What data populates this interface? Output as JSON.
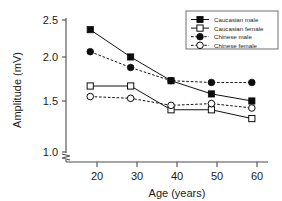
{
  "chart_data": {
    "type": "line",
    "title": "",
    "xlabel": "Age (years)",
    "ylabel": "Amplitude (mV)",
    "x": [
      20,
      30,
      40,
      50,
      60
    ],
    "xticklabels": [
      "20",
      "30",
      "40",
      "50",
      "60"
    ],
    "yticklabels": [
      "1.0",
      "1.5",
      "2.0",
      "2.5"
    ],
    "yticks": [
      1.0,
      1.5,
      2.0,
      2.5
    ],
    "xlim": [
      14,
      64
    ],
    "ylim": [
      0.95,
      2.55
    ],
    "grid": false,
    "axis_break_y": true,
    "legend_position": "top-right",
    "series": [
      {
        "name": "Caucasian male",
        "marker": "filled-square",
        "linestyle": "solid",
        "color": "#0d0d0d",
        "values": [
          2.39,
          2.08,
          1.81,
          1.66,
          1.58
        ]
      },
      {
        "name": "Caucasian female",
        "marker": "open-square",
        "linestyle": "solid",
        "color": "#0d0d0d",
        "values": [
          1.75,
          1.75,
          1.48,
          1.48,
          1.38
        ]
      },
      {
        "name": "Chinese male",
        "marker": "filled-circle",
        "linestyle": "dashed",
        "color": "#0d0d0d",
        "values": [
          2.14,
          1.96,
          1.81,
          1.79,
          1.79
        ]
      },
      {
        "name": "Chinese female",
        "marker": "open-circle",
        "linestyle": "dashed",
        "color": "#0d0d0d",
        "values": [
          1.63,
          1.61,
          1.53,
          1.55,
          1.5
        ]
      }
    ]
  }
}
